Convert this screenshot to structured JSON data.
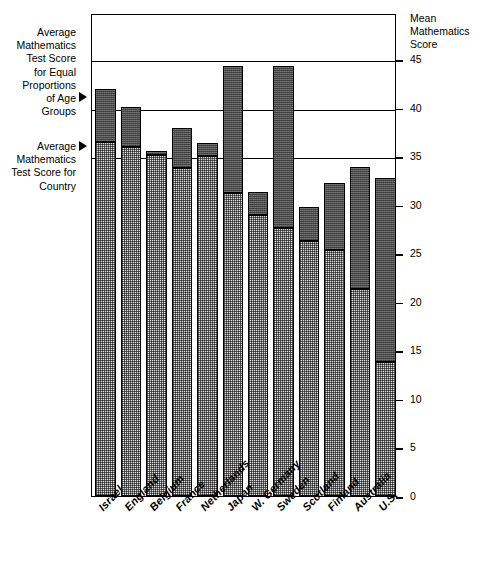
{
  "chart_data": {
    "type": "bar",
    "title": "",
    "subtitle": "",
    "xlabel": "",
    "ylabel": "Mean Mathematics Score",
    "ylim": [
      0,
      45
    ],
    "ytick_values": [
      0,
      5,
      10,
      15,
      20,
      25,
      30,
      35,
      40,
      45
    ],
    "ytick_labels": [
      "0",
      "5",
      "10",
      "15",
      "20",
      "25",
      "30",
      "35",
      "40",
      "45"
    ],
    "gridlines": [
      35,
      40,
      45
    ],
    "grid": true,
    "legend_position": "left-annotations",
    "categories": [
      "Israel",
      "England",
      "Belgium",
      "France",
      "Netherlands",
      "Japan",
      "W. Germany",
      "Sweden",
      "Scotland",
      "Finland",
      "Australia",
      "U.S."
    ],
    "series": [
      {
        "name": "Average Mathematics Test Score for Country",
        "pattern": "light-stipple",
        "color": "#d9d9d9",
        "values": [
          36.5,
          35.9,
          35.1,
          33.8,
          35.0,
          31.2,
          28.9,
          27.6,
          26.3,
          25.3,
          21.3,
          13.8
        ]
      },
      {
        "name": "Average Mathematics Test Score for Equal Proportions of Age Groups",
        "pattern": "dark-stipple",
        "color": "#636363",
        "values": [
          41.9,
          40.1,
          35.5,
          37.9,
          36.3,
          44.3,
          31.3,
          44.3,
          29.8,
          32.2,
          33.9,
          32.7
        ]
      }
    ]
  },
  "annotations": {
    "equal_proportions": {
      "text": "Average Mathematics Test Score for Equal Proportions of Age Groups",
      "lines": [
        "Average",
        "Mathematics",
        "Test Score",
        "for Equal",
        "Proportions",
        "of Age",
        "Groups"
      ],
      "marker": "pointer-triangle"
    },
    "country": {
      "text": "Average Mathematics Test Score for Country",
      "lines": [
        "Average",
        "Mathematics",
        "Test Score for",
        "Country"
      ],
      "marker": "pointer-triangle"
    }
  },
  "axis": {
    "right_title_lines": [
      "Mean",
      "Mathematics",
      "Score"
    ]
  }
}
